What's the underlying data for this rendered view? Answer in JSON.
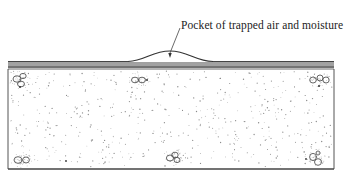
{
  "diagram": {
    "annotation": "Pocket of trapped air and moisture",
    "colors": {
      "ink": "#333333",
      "membrane": "#444444",
      "stipple": "#8a8a8a",
      "background": "#ffffff"
    },
    "components": {
      "membrane_layers": "Layered roofing membrane (multiple plies)",
      "blister": "Raised blister in membrane",
      "substrate": "Stippled concrete/insulation deck with aggregate"
    }
  }
}
